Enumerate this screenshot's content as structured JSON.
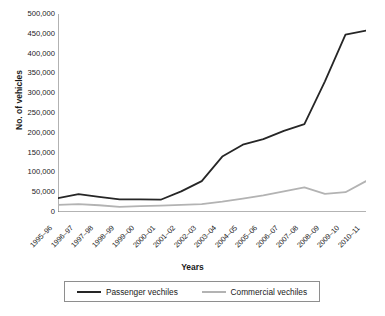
{
  "chart_data": {
    "type": "line",
    "title": "",
    "xlabel": "Years",
    "ylabel": "No. of vehicles",
    "ylim": [
      0,
      500000
    ],
    "ytick_step": 50000,
    "grid": false,
    "legend_position": "bottom",
    "yticks": [
      "500,000",
      "450,000",
      "400,000",
      "350,000",
      "300,000",
      "250,000",
      "200,000",
      "150,000",
      "100,000",
      "50,000",
      "0"
    ],
    "ytick_values": [
      500000,
      450000,
      400000,
      350000,
      300000,
      250000,
      200000,
      150000,
      100000,
      50000,
      0
    ],
    "categories": [
      "1995–96",
      "1996–97",
      "1997–98",
      "1998–99",
      "1999–00",
      "2000–01",
      "2001–02",
      "2002–03",
      "2003–04",
      "2004–05",
      "2005–06",
      "2006–07",
      "2007–08",
      "2008–09",
      "2009–10",
      "2010–11"
    ],
    "series": [
      {
        "name": "Passenger vechiles",
        "color": "#262626",
        "width": 1.8,
        "values": [
          35000,
          45000,
          38000,
          32000,
          32000,
          31000,
          52000,
          78000,
          140000,
          170000,
          184000,
          205000,
          222000,
          330000,
          448000,
          458000
        ]
      },
      {
        "name": "Commercial vechiles",
        "color": "#b3b3b3",
        "width": 1.8,
        "values": [
          18000,
          20000,
          17000,
          13000,
          15000,
          16000,
          18000,
          20000,
          26000,
          34000,
          42000,
          52000,
          62000,
          46000,
          50000,
          78000
        ]
      }
    ]
  },
  "axes": {
    "y_title": "No. of vehicles",
    "x_title": "Years"
  },
  "legend": {
    "items": [
      {
        "label": "Passenger vechiles",
        "color": "#262626"
      },
      {
        "label": "Commercial vechiles",
        "color": "#b3b3b3"
      }
    ]
  }
}
